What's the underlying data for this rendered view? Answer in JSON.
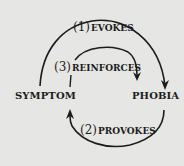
{
  "diagram": {
    "nodes": [
      {
        "id": "symptom",
        "label": "SYMPTOM"
      },
      {
        "id": "phobia",
        "label": "PHOBIA"
      }
    ],
    "edges": [
      {
        "id": "edge1",
        "number": "(1)",
        "label": "EVOKES",
        "from": "symptom",
        "to": "phobia"
      },
      {
        "id": "edge2",
        "number": "(2)",
        "label": "PROVOKES",
        "from": "phobia",
        "to": "symptom"
      },
      {
        "id": "edge3",
        "number": "(3)",
        "label": "REINFORCES",
        "from": "symptom",
        "to": "phobia"
      }
    ],
    "colors": {
      "background": "#e6e6e4",
      "ink": "#1c1c1c"
    }
  }
}
